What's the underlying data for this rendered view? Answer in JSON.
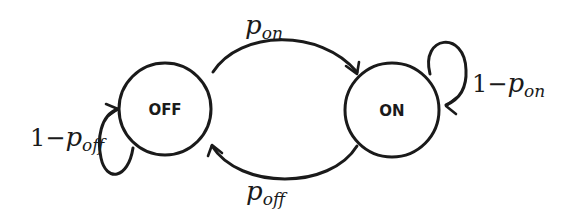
{
  "diagram": {
    "type": "markov-chain-state-diagram",
    "states": [
      {
        "id": "off",
        "label": "OFF"
      },
      {
        "id": "on",
        "label": "ON"
      }
    ],
    "transitions": [
      {
        "from": "off",
        "to": "on",
        "prefix": "",
        "symbol": "p",
        "subscript": "on"
      },
      {
        "from": "on",
        "to": "off",
        "prefix": "",
        "symbol": "p",
        "subscript": "off"
      },
      {
        "from": "on",
        "to": "on",
        "prefix": "1−",
        "symbol": "p",
        "subscript": "on"
      },
      {
        "from": "off",
        "to": "off",
        "prefix": "1−",
        "symbol": "p",
        "subscript": "off"
      }
    ]
  }
}
